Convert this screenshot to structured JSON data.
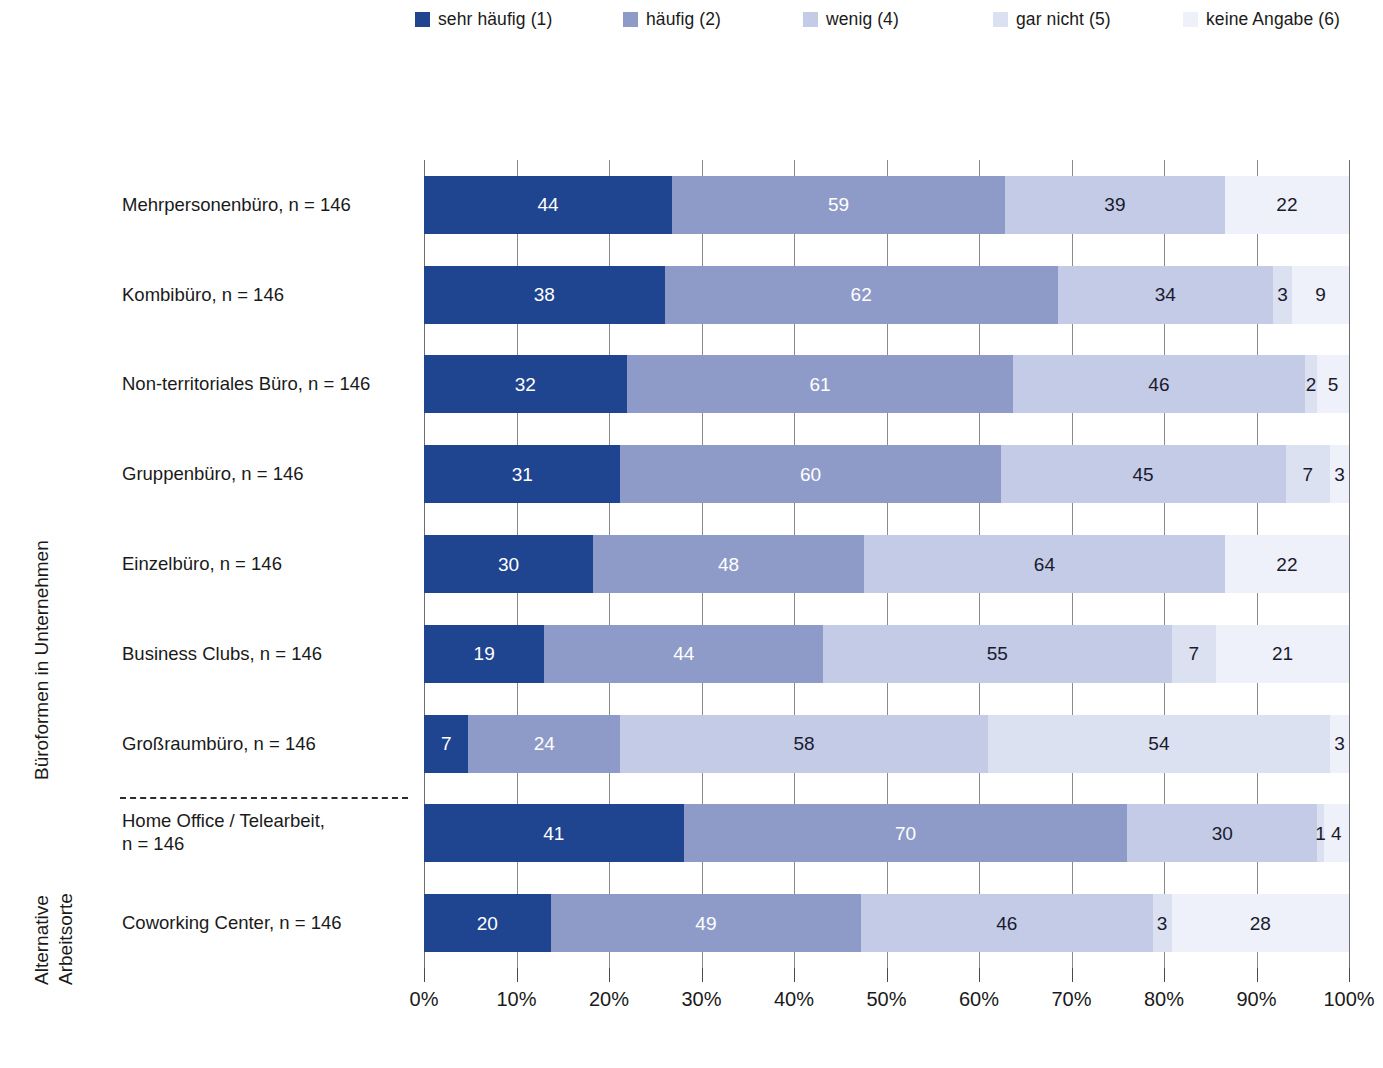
{
  "legend": {
    "items": [
      {
        "label": "sehr häufig (1)",
        "color": "#1f4490"
      },
      {
        "label": "häufig (2)",
        "color": "#8e9bc8"
      },
      {
        "label": "wenig (4)",
        "color": "#c3cbe6"
      },
      {
        "label": "gar nicht (5)",
        "color": "#dce1f1"
      },
      {
        "label": "keine Angabe (6)",
        "color": "#eef1f9"
      }
    ]
  },
  "axis_titles": {
    "group1": "Büroformen in Unternehmen",
    "group2_line1": "Alternative",
    "group2_line2": "Arbeitsorte"
  },
  "chart_data": {
    "type": "bar",
    "orientation": "horizontal",
    "stacked": true,
    "normalized": true,
    "title": "",
    "xlabel": "",
    "ylabel": "",
    "xlim": [
      0,
      100
    ],
    "xticks": [
      "0%",
      "10%",
      "20%",
      "30%",
      "40%",
      "50%",
      "60%",
      "70%",
      "80%",
      "90%",
      "100%"
    ],
    "grid": true,
    "legend_position": "top",
    "total_n": 146,
    "series": [
      {
        "name": "sehr häufig (1)",
        "color": "#1f4490",
        "label_color": "light"
      },
      {
        "name": "häufig (2)",
        "color": "#8e9bc8",
        "label_color": "light"
      },
      {
        "name": "wenig (4)",
        "color": "#c3cbe6",
        "label_color": "dark"
      },
      {
        "name": "gar nicht (5)",
        "color": "#dce1f1",
        "label_color": "dark"
      },
      {
        "name": "keine Angabe (6)",
        "color": "#eef1f9",
        "label_color": "dark"
      }
    ],
    "categories": [
      "Mehrpersonenbüro, n = 146",
      "Kombibüro, n = 146",
      "Non-territoriales Büro, n = 146",
      "Gruppenbüro, n = 146",
      "Einzelbüro, n = 146",
      "Business Clubs, n = 146",
      "Großraumbüro, n = 146",
      "Home Office / Telearbeit,\nn = 146",
      "Coworking Center, n = 146"
    ],
    "rows": [
      {
        "category": "Mehrpersonenbüro, n = 146",
        "values": [
          44,
          59,
          39,
          0,
          22
        ]
      },
      {
        "category": "Kombibüro, n = 146",
        "values": [
          38,
          62,
          34,
          3,
          9
        ]
      },
      {
        "category": "Non-territoriales Büro, n = 146",
        "values": [
          32,
          61,
          46,
          2,
          5
        ]
      },
      {
        "category": "Gruppenbüro, n = 146",
        "values": [
          31,
          60,
          45,
          7,
          3
        ]
      },
      {
        "category": "Einzelbüro, n = 146",
        "values": [
          30,
          48,
          64,
          0,
          22
        ]
      },
      {
        "category": "Business Clubs, n = 146",
        "values": [
          19,
          44,
          55,
          7,
          21
        ]
      },
      {
        "category": "Großraumbüro, n = 146",
        "values": [
          7,
          24,
          58,
          54,
          3
        ]
      },
      {
        "category": "Home Office / Telearbeit, n = 146",
        "values": [
          41,
          70,
          30,
          1,
          4
        ]
      },
      {
        "category": "Coworking Center, n = 146",
        "values": [
          20,
          49,
          46,
          3,
          28
        ]
      }
    ]
  }
}
